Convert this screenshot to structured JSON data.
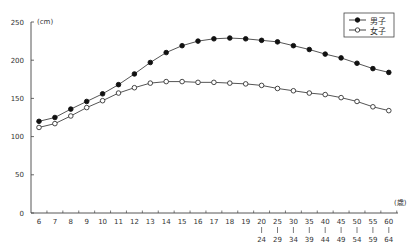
{
  "chart_data": {
    "type": "line",
    "title": "",
    "xlabel": "(歳)",
    "ylabel": "(cm)",
    "ylim": [
      0,
      250
    ],
    "yticks": [
      0,
      50,
      100,
      150,
      200,
      250
    ],
    "grid": false,
    "legend_position": "top-right",
    "categories": [
      "6",
      "7",
      "8",
      "9",
      "10",
      "11",
      "12",
      "13",
      "14",
      "15",
      "16",
      "17",
      "18",
      "19",
      "20-24",
      "25-29",
      "30-34",
      "35-39",
      "40-44",
      "45-49",
      "50-54",
      "55-59",
      "60-64"
    ],
    "category_labels": [
      {
        "top": "6"
      },
      {
        "top": "7"
      },
      {
        "top": "8"
      },
      {
        "top": "9"
      },
      {
        "top": "10"
      },
      {
        "top": "11"
      },
      {
        "top": "12"
      },
      {
        "top": "13"
      },
      {
        "top": "14"
      },
      {
        "top": "15"
      },
      {
        "top": "16"
      },
      {
        "top": "17"
      },
      {
        "top": "18"
      },
      {
        "top": "19"
      },
      {
        "top": "20",
        "bottom": "24"
      },
      {
        "top": "25",
        "bottom": "29"
      },
      {
        "top": "30",
        "bottom": "34"
      },
      {
        "top": "35",
        "bottom": "39"
      },
      {
        "top": "40",
        "bottom": "44"
      },
      {
        "top": "45",
        "bottom": "49"
      },
      {
        "top": "50",
        "bottom": "54"
      },
      {
        "top": "55",
        "bottom": "59"
      },
      {
        "top": "60",
        "bottom": "64"
      }
    ],
    "series": [
      {
        "name": "男子",
        "marker": "filled-circle",
        "values": [
          120,
          125,
          136,
          146,
          156,
          168,
          182,
          197,
          210,
          219,
          225,
          228,
          229,
          228,
          226,
          224,
          219,
          214,
          208,
          203,
          196,
          189,
          184
        ]
      },
      {
        "name": "女子",
        "marker": "open-circle",
        "values": [
          112,
          117,
          127,
          138,
          147,
          157,
          164,
          170,
          172,
          172,
          171,
          171,
          170,
          169,
          167,
          163,
          160,
          157,
          155,
          151,
          146,
          139,
          134
        ]
      }
    ]
  },
  "legend": {
    "male_label": "男子",
    "female_label": "女子"
  },
  "axis": {
    "y_unit": "(cm)",
    "x_unit": "(歳)"
  }
}
